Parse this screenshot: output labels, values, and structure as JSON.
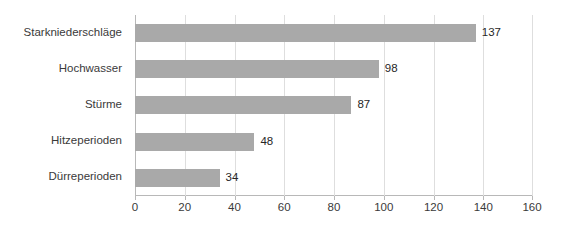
{
  "chart_data": {
    "type": "bar",
    "orientation": "horizontal",
    "title": "",
    "subtitle": "",
    "xlabel": "",
    "ylabel": "",
    "categories": [
      "Starkniederschläge",
      "Hochwasser",
      "Stürme",
      "Hitzeperioden",
      "Dürreperioden"
    ],
    "values": [
      137,
      98,
      87,
      48,
      34
    ],
    "value_labels": [
      "137",
      "98",
      "87",
      "48",
      "34"
    ],
    "xlim": [
      0,
      160
    ],
    "xticks": [
      0,
      20,
      40,
      60,
      80,
      100,
      120,
      140,
      160
    ],
    "xtick_labels": [
      "0",
      "20",
      "40",
      "60",
      "80",
      "100",
      "120",
      "140",
      "160"
    ],
    "grid": "vertical",
    "legend": "none",
    "colors": {
      "bar": "#a9a9a9",
      "gridline": "#dedede",
      "axis": "#b8b8b8",
      "text": "#3a3a3a",
      "background": "#ffffff"
    }
  }
}
